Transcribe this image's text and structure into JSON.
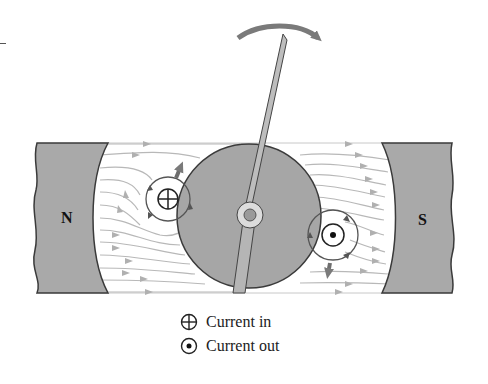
{
  "diagram": {
    "type": "galvanometer-motor-principle",
    "poles": {
      "north_label": "N",
      "south_label": "S"
    },
    "rotation_arrow": "clockwise",
    "conductors": [
      {
        "name": "left-conductor",
        "symbol": "cross",
        "meaning": "Current in"
      },
      {
        "name": "right-conductor",
        "symbol": "dot",
        "meaning": "Current out"
      }
    ],
    "force_arrows": [
      "up-right on left conductor",
      "down on right conductor"
    ]
  },
  "legend": {
    "items": [
      {
        "symbol": "circle-cross",
        "label": "Current in"
      },
      {
        "symbol": "circle-dot",
        "label": "Current out"
      }
    ]
  },
  "colors": {
    "pole_fill": "#a9a9a9",
    "core_fill": "#a6a6a6",
    "field_line": "#b4b4b4",
    "arrow": "#7a7a7a",
    "outline": "#3a3a3a"
  }
}
